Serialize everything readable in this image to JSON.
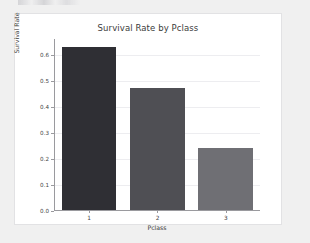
{
  "figure": {
    "background_color": "#ffffff",
    "page_background_color": "#f0f0f0",
    "card_border_color": "#e2e2e4"
  },
  "chart_data": {
    "type": "bar",
    "title": "Survival Rate by Pclass",
    "xlabel": "Pclass",
    "ylabel": "Survival Rate",
    "categories": [
      "1",
      "2",
      "3"
    ],
    "values": [
      0.63,
      0.47,
      0.24
    ],
    "bar_colors": [
      "#2f2f34",
      "#4f4f54",
      "#6f6f74"
    ],
    "ylim": [
      0.0,
      0.66
    ],
    "yticks": [
      0.0,
      0.1,
      0.2,
      0.3,
      0.4,
      0.5,
      0.6
    ],
    "ytick_labels": [
      "0.0",
      "0.1",
      "0.2",
      "0.3",
      "0.4",
      "0.5",
      "0.6"
    ],
    "grid": true,
    "grid_axis": "y",
    "grid_color": "#ededf0",
    "legend": false,
    "axis_color": "#9a9a9e"
  }
}
